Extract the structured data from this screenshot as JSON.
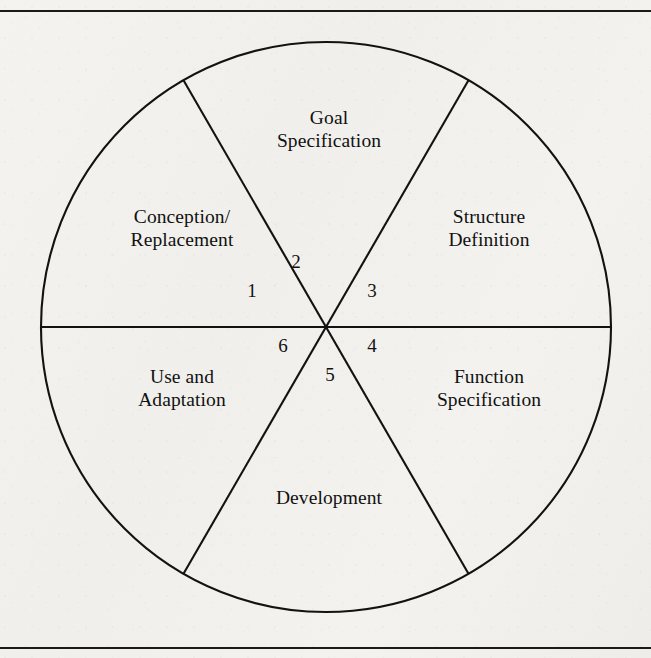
{
  "figure": {
    "type": "pie-cycle-diagram",
    "title_visible": false,
    "shape": "circle divided into six sectors by three diameters",
    "background_color": "#f1f0ed",
    "line_color": "#111111",
    "frame": {
      "top_rule": true,
      "bottom_rule": true
    },
    "circle": {
      "center_x": 326,
      "center_y": 327,
      "radius": 285
    },
    "segments": [
      {
        "number": "1",
        "label": "Conception/\nReplacement",
        "label_x": 182,
        "label_y": 219,
        "number_x": 252,
        "number_y": 292,
        "start_angle_deg": 120,
        "end_angle_deg": 180
      },
      {
        "number": "2",
        "label": "Goal\nSpecification",
        "label_x": 329,
        "label_y": 120,
        "number_x": 296,
        "number_y": 263,
        "start_angle_deg": 60,
        "end_angle_deg": 120
      },
      {
        "number": "3",
        "label": "Structure\nDefinition",
        "label_x": 489,
        "label_y": 219,
        "number_x": 372,
        "number_y": 292,
        "start_angle_deg": 0,
        "end_angle_deg": 60
      },
      {
        "number": "4",
        "label": "Function\nSpecification",
        "label_x": 489,
        "label_y": 379,
        "number_x": 372,
        "number_y": 347,
        "start_angle_deg": -60,
        "end_angle_deg": 0
      },
      {
        "number": "5",
        "label": "Development",
        "label_x": 329,
        "label_y": 500,
        "number_x": 330,
        "number_y": 376,
        "start_angle_deg": -120,
        "end_angle_deg": -60
      },
      {
        "number": "6",
        "label": "Use and\nAdaptation",
        "label_x": 182,
        "label_y": 379,
        "number_x": 283,
        "number_y": 347,
        "start_angle_deg": 180,
        "end_angle_deg": -120
      }
    ],
    "divider_lines": [
      {
        "name": "horizontal-diameter",
        "angle_deg": 0
      },
      {
        "name": "upper-left-to-lower-right-diameter",
        "angle_deg": 60
      },
      {
        "name": "upper-right-to-lower-left-diameter",
        "angle_deg": 120
      }
    ]
  },
  "chart_data": {
    "type": "pie",
    "title": "",
    "categories": [
      "Conception/Replacement",
      "Goal Specification",
      "Structure Definition",
      "Function Specification",
      "Development",
      "Use and Adaptation"
    ],
    "values": [
      1,
      1,
      1,
      1,
      1,
      1
    ],
    "slice_labels": [
      "1",
      "2",
      "3",
      "4",
      "5",
      "6"
    ],
    "slice_degrees": [
      60,
      60,
      60,
      60,
      60,
      60
    ],
    "legend_position": "none",
    "grid": false,
    "xlabel": "",
    "ylabel": ""
  }
}
